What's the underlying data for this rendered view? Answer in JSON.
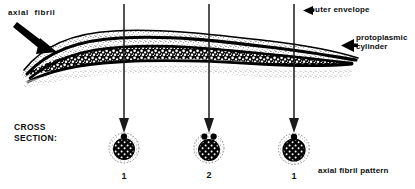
{
  "figure": {
    "type": "scientific-diagram",
    "background_color": "#ffffff",
    "ink_color": "#000000"
  },
  "labels": {
    "axial_fibril": "axial  fibril",
    "outer_envelope": "outer envelope",
    "protoplasmic_cylinder_line1": "protoplasmic",
    "protoplasmic_cylinder_line2": "cylinder",
    "cross_section_line1": "CROSS",
    "cross_section_line2": "SECTION:",
    "axial_fibril_pattern": "axial fibril pattern"
  },
  "cross_sections": [
    {
      "id": "cs-1",
      "number": "1",
      "top_dots": 1,
      "cx": 124,
      "cy": 148
    },
    {
      "id": "cs-2",
      "number": "2",
      "top_dots": 2,
      "cx": 209,
      "cy": 148
    },
    {
      "id": "cs-3",
      "number": "1",
      "top_dots": 1,
      "cx": 294,
      "cy": 148
    }
  ],
  "callout_arrows": [
    {
      "name": "axial-fibril-arrow",
      "direction": "down-right"
    },
    {
      "name": "outer-envelope-arrow",
      "direction": "left"
    },
    {
      "name": "protoplasmic-cylinder-arrow",
      "direction": "left"
    }
  ],
  "section_arrows": [
    {
      "name": "section-arrow-1",
      "x": 124
    },
    {
      "name": "section-arrow-2",
      "x": 209
    },
    {
      "name": "section-arrow-3",
      "x": 294
    }
  ]
}
